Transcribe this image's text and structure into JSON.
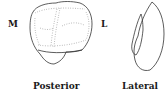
{
  "diagram": {
    "views": [
      {
        "id": "posterior",
        "caption": "Posterior",
        "side_labels": {
          "left": "M",
          "right": "L"
        }
      },
      {
        "id": "lateral",
        "caption": "Lateral"
      }
    ],
    "colors": {
      "outline": "#333333",
      "dotted_lines": "#8a8a8a",
      "text": "#1a1a1a",
      "background": "#ffffff"
    }
  }
}
